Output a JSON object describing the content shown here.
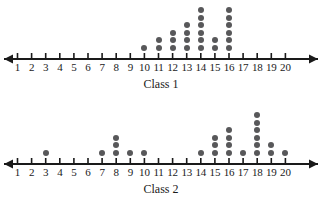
{
  "chart_data": {
    "type": "dotplot",
    "title": "",
    "xlabel": "",
    "ylabel": "",
    "xlim": [
      1,
      20
    ],
    "grid": false,
    "legend": "none",
    "dot_color": "#58585a",
    "axis_color": "#1a1a1a",
    "ticks": [
      1,
      2,
      3,
      4,
      5,
      6,
      7,
      8,
      9,
      10,
      11,
      12,
      13,
      14,
      15,
      16,
      17,
      18,
      19,
      20
    ],
    "tick_labels": [
      "1",
      "2",
      "3",
      "4",
      "5",
      "6",
      "7",
      "8",
      "9",
      "10",
      "11",
      "12",
      "13",
      "14",
      "15",
      "16",
      "17",
      "18",
      "19",
      "20"
    ],
    "plots": [
      {
        "id": "class-1",
        "caption": "Class 1",
        "categories": [
          1,
          2,
          3,
          4,
          5,
          6,
          7,
          8,
          9,
          10,
          11,
          12,
          13,
          14,
          15,
          16,
          17,
          18,
          19,
          20
        ],
        "values": [
          0,
          0,
          0,
          0,
          0,
          0,
          0,
          0,
          0,
          1,
          2,
          3,
          4,
          6,
          2,
          6,
          0,
          0,
          0,
          0
        ],
        "total": 24
      },
      {
        "id": "class-2",
        "caption": "Class 2",
        "categories": [
          1,
          2,
          3,
          4,
          5,
          6,
          7,
          8,
          9,
          10,
          11,
          12,
          13,
          14,
          15,
          16,
          17,
          18,
          19,
          20
        ],
        "values": [
          0,
          0,
          1,
          0,
          0,
          0,
          1,
          3,
          1,
          1,
          0,
          0,
          0,
          1,
          3,
          4,
          1,
          6,
          2,
          1
        ],
        "total": 25
      }
    ]
  }
}
